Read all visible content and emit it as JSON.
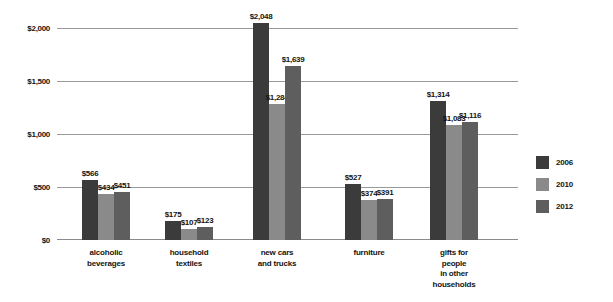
{
  "chart_data": {
    "type": "bar",
    "title": "",
    "subtitle": "",
    "xlabel": "",
    "ylabel": "",
    "ylim": [
      0,
      2200
    ],
    "grid": true,
    "legend_position": "right",
    "categories": [
      "alcoholic\nbeverages",
      "household\ntextiles",
      "new cars\nand trucks",
      "furniture",
      "gifts for\npeople\nin other\nhouseholds"
    ],
    "category_lines": [
      [
        "alcoholic",
        "beverages"
      ],
      [
        "household",
        "textiles"
      ],
      [
        "new cars",
        "and trucks"
      ],
      [
        "furniture"
      ],
      [
        "gifts for",
        "people",
        "in other",
        "households"
      ]
    ],
    "series": [
      {
        "name": "2006",
        "color": "#3b3b3b",
        "values": [
          566,
          175,
          2048,
          527,
          1314
        ]
      },
      {
        "name": "2010",
        "color": "#8a8a8a",
        "values": [
          434,
          107,
          1284,
          374,
          1083
        ]
      },
      {
        "name": "2012",
        "color": "#5e5e5e",
        "values": [
          451,
          123,
          1639,
          391,
          1116
        ]
      }
    ],
    "value_labels": [
      [
        "$566",
        "$434",
        "$451"
      ],
      [
        "$175",
        "$107",
        "$123"
      ],
      [
        "$2,048",
        "$1,284",
        "$1,639"
      ],
      [
        "$527",
        "$374",
        "$391"
      ],
      [
        "$1,314",
        "$1,083",
        "$1,116"
      ]
    ],
    "yticks": [
      0,
      500,
      1000,
      1500,
      2000
    ],
    "ytick_labels": [
      "$0",
      "$500",
      "$1,000",
      "$1,500",
      "$2,000"
    ]
  },
  "legend": {
    "items": [
      {
        "label": "2006",
        "color": "#3b3b3b"
      },
      {
        "label": "2010",
        "color": "#8a8a8a"
      },
      {
        "label": "2012",
        "color": "#5e5e5e"
      }
    ]
  },
  "axis": {
    "y_labels": [
      "$2,000",
      "$1,500",
      "$1,000",
      "$500",
      "$0"
    ]
  }
}
